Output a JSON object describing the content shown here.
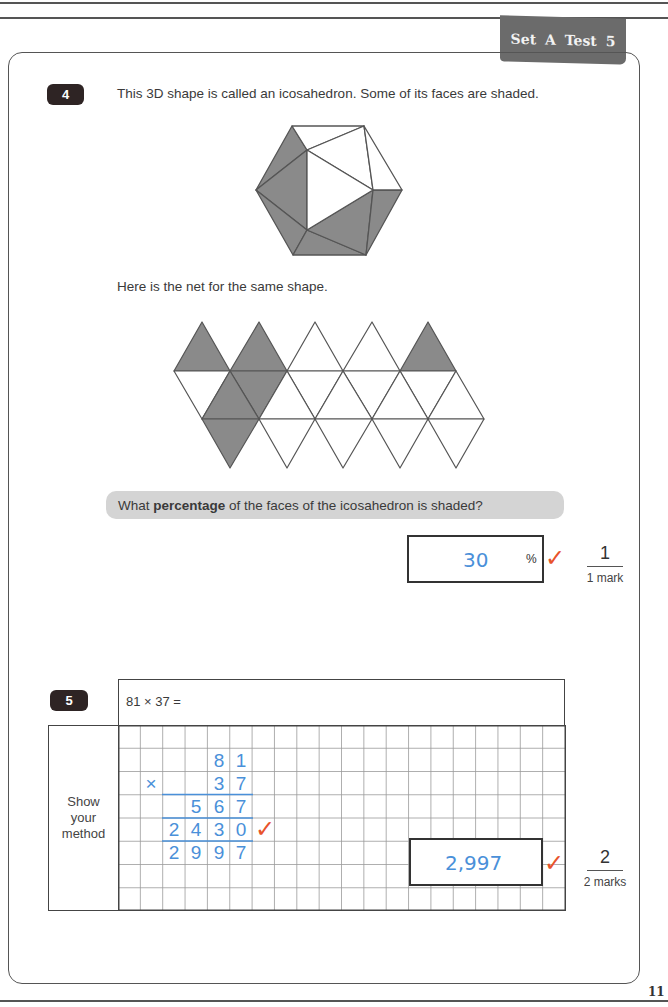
{
  "header": {
    "tab_label": "Set A  Test 5",
    "page_number": "11"
  },
  "question4": {
    "number": "4",
    "intro": "This 3D shape is called an icosahedron. Some of its faces are shaded.",
    "net_intro": "Here is the net for the same shape.",
    "prompt_before": "What ",
    "prompt_bold": "percentage",
    "prompt_after": " of the faces of the icosahedron is shaded?",
    "answer": "30",
    "unit": "%",
    "tick": "✓",
    "marks_awarded": "1",
    "marks_label": "1 mark",
    "shape_faces_shaded": 6,
    "shape_faces_total": 20,
    "colors": {
      "shaded": "#8a8a8a",
      "line": "#555555"
    }
  },
  "question5": {
    "number": "5",
    "problem": "81 × 37 =",
    "method_label_lines": [
      "Show",
      "your",
      "method"
    ],
    "working": {
      "row1": [
        "8",
        "1"
      ],
      "operator": "×",
      "row2": [
        "3",
        "7"
      ],
      "partial1": [
        "5",
        "6",
        "7"
      ],
      "partial2": [
        "2",
        "4",
        "3",
        "0"
      ],
      "total": [
        "2",
        "9",
        "9",
        "7"
      ]
    },
    "working_tick": "✓",
    "answer": "2,997",
    "answer_tick": "✓",
    "marks_awarded": "2",
    "marks_label": "2 marks",
    "colors": {
      "handwriting": "#4a90d9",
      "tick": "#e8532b"
    }
  }
}
